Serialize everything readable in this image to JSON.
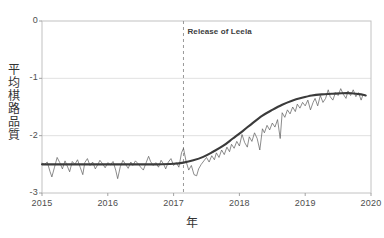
{
  "chart_data": {
    "type": "line",
    "title": "",
    "xlabel": "年",
    "ylabel": "平均棋路品質",
    "xlim": [
      2015.0,
      2020.0
    ],
    "ylim": [
      -3,
      0
    ],
    "grid": true,
    "legend": null,
    "xticks": [
      "2015",
      "2016",
      "2017",
      "2018",
      "2019",
      "2020"
    ],
    "xtick_values": [
      2015,
      2016,
      2017,
      2018,
      2019,
      2020
    ],
    "yticks": [
      "0",
      "-1",
      "-2",
      "-3"
    ],
    "ytick_values": [
      0,
      -1,
      -2,
      -3
    ],
    "annotations": [
      {
        "label": "Release of Leela",
        "x": 2017.15,
        "type": "vertical-dashed-line",
        "color": "#9a9a9a",
        "label_y": -0.2
      }
    ],
    "series": [
      {
        "name": "raw",
        "style": "thin-noisy-line",
        "color": "#5a5a5a",
        "x": [
          2015.0,
          2015.04,
          2015.08,
          2015.12,
          2015.15,
          2015.19,
          2015.23,
          2015.27,
          2015.31,
          2015.35,
          2015.38,
          2015.42,
          2015.46,
          2015.5,
          2015.54,
          2015.58,
          2015.62,
          2015.65,
          2015.69,
          2015.73,
          2015.77,
          2015.81,
          2015.85,
          2015.88,
          2015.92,
          2015.96,
          2016.0,
          2016.04,
          2016.08,
          2016.12,
          2016.15,
          2016.19,
          2016.23,
          2016.27,
          2016.31,
          2016.35,
          2016.38,
          2016.42,
          2016.46,
          2016.5,
          2016.54,
          2016.58,
          2016.62,
          2016.65,
          2016.69,
          2016.73,
          2016.77,
          2016.81,
          2016.85,
          2016.88,
          2016.92,
          2016.96,
          2017.0,
          2017.04,
          2017.08,
          2017.12,
          2017.15,
          2017.19,
          2017.23,
          2017.27,
          2017.31,
          2017.35,
          2017.38,
          2017.42,
          2017.46,
          2017.5,
          2017.54,
          2017.58,
          2017.62,
          2017.65,
          2017.69,
          2017.73,
          2017.77,
          2017.81,
          2017.85,
          2017.88,
          2017.92,
          2017.96,
          2018.0,
          2018.04,
          2018.08,
          2018.12,
          2018.15,
          2018.19,
          2018.23,
          2018.27,
          2018.31,
          2018.35,
          2018.38,
          2018.42,
          2018.46,
          2018.5,
          2018.54,
          2018.58,
          2018.62,
          2018.65,
          2018.69,
          2018.73,
          2018.77,
          2018.81,
          2018.85,
          2018.88,
          2018.92,
          2018.96,
          2019.0,
          2019.04,
          2019.08,
          2019.12,
          2019.15,
          2019.19,
          2019.23,
          2019.27,
          2019.31,
          2019.35,
          2019.38,
          2019.42,
          2019.46,
          2019.5,
          2019.54,
          2019.58,
          2019.62,
          2019.65,
          2019.69,
          2019.73,
          2019.77,
          2019.81,
          2019.85,
          2019.88,
          2019.92
        ],
        "y": [
          -2.48,
          -2.5,
          -2.46,
          -2.62,
          -2.72,
          -2.55,
          -2.38,
          -2.47,
          -2.58,
          -2.44,
          -2.52,
          -2.63,
          -2.45,
          -2.5,
          -2.42,
          -2.55,
          -2.68,
          -2.47,
          -2.4,
          -2.52,
          -2.46,
          -2.58,
          -2.5,
          -2.43,
          -2.49,
          -2.56,
          -2.47,
          -2.51,
          -2.45,
          -2.6,
          -2.75,
          -2.54,
          -2.43,
          -2.5,
          -2.57,
          -2.46,
          -2.52,
          -2.44,
          -2.49,
          -2.55,
          -2.6,
          -2.48,
          -2.36,
          -2.45,
          -2.52,
          -2.47,
          -2.55,
          -2.43,
          -2.5,
          -2.58,
          -2.46,
          -2.4,
          -2.52,
          -2.47,
          -2.55,
          -2.3,
          -2.22,
          -2.45,
          -2.6,
          -2.52,
          -2.68,
          -2.7,
          -2.58,
          -2.5,
          -2.44,
          -2.38,
          -2.46,
          -2.35,
          -2.42,
          -2.3,
          -2.38,
          -2.25,
          -2.33,
          -2.2,
          -2.28,
          -2.15,
          -2.22,
          -2.1,
          -2.18,
          -1.98,
          -2.12,
          -2.2,
          -2.02,
          -2.1,
          -1.95,
          -2.05,
          -2.25,
          -1.88,
          -1.95,
          -1.82,
          -1.9,
          -1.78,
          -1.85,
          -1.72,
          -2.05,
          -1.6,
          -1.68,
          -1.55,
          -1.62,
          -1.5,
          -1.58,
          -1.45,
          -1.52,
          -1.42,
          -1.48,
          -1.38,
          -1.55,
          -1.42,
          -1.35,
          -1.48,
          -1.3,
          -1.42,
          -1.35,
          -1.2,
          -1.32,
          -1.38,
          -1.25,
          -1.3,
          -1.18,
          -1.28,
          -1.35,
          -1.22,
          -1.3,
          -1.2,
          -1.32,
          -1.25,
          -1.38,
          -1.28,
          -1.3
        ]
      },
      {
        "name": "trend",
        "style": "thick-smooth-line",
        "color": "#3b3b3b",
        "x": [
          2015.0,
          2015.25,
          2015.5,
          2015.75,
          2016.0,
          2016.25,
          2016.5,
          2016.75,
          2017.0,
          2017.15,
          2017.3,
          2017.45,
          2017.6,
          2017.75,
          2017.9,
          2018.05,
          2018.2,
          2018.35,
          2018.5,
          2018.65,
          2018.8,
          2018.95,
          2019.1,
          2019.25,
          2019.4,
          2019.55,
          2019.7,
          2019.85,
          2019.92
        ],
        "y": [
          -2.5,
          -2.5,
          -2.5,
          -2.5,
          -2.5,
          -2.5,
          -2.5,
          -2.5,
          -2.49,
          -2.47,
          -2.43,
          -2.37,
          -2.28,
          -2.18,
          -2.05,
          -1.92,
          -1.78,
          -1.65,
          -1.55,
          -1.46,
          -1.39,
          -1.34,
          -1.3,
          -1.28,
          -1.27,
          -1.26,
          -1.26,
          -1.28,
          -1.3
        ]
      }
    ]
  },
  "axes": {
    "plot_left": 42,
    "plot_right": 371,
    "plot_top": 21,
    "plot_bottom": 193
  }
}
